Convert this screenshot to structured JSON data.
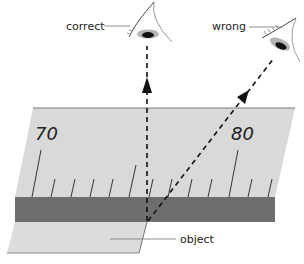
{
  "labels": {
    "correct": "correct",
    "wrong": "wrong",
    "object": "object"
  },
  "scale": {
    "major_ticks": [
      "70",
      "80"
    ]
  },
  "colors": {
    "ruler_fill": "#d9d9d9",
    "ruler_edge": "#7a7a7a",
    "object_band": "#6e6e6e",
    "sheet_fill": "#dcdcdc",
    "line": "#111111",
    "leader": "#777777",
    "eye_iris": "#111111",
    "eye_shadow": "#b5b5b5"
  }
}
